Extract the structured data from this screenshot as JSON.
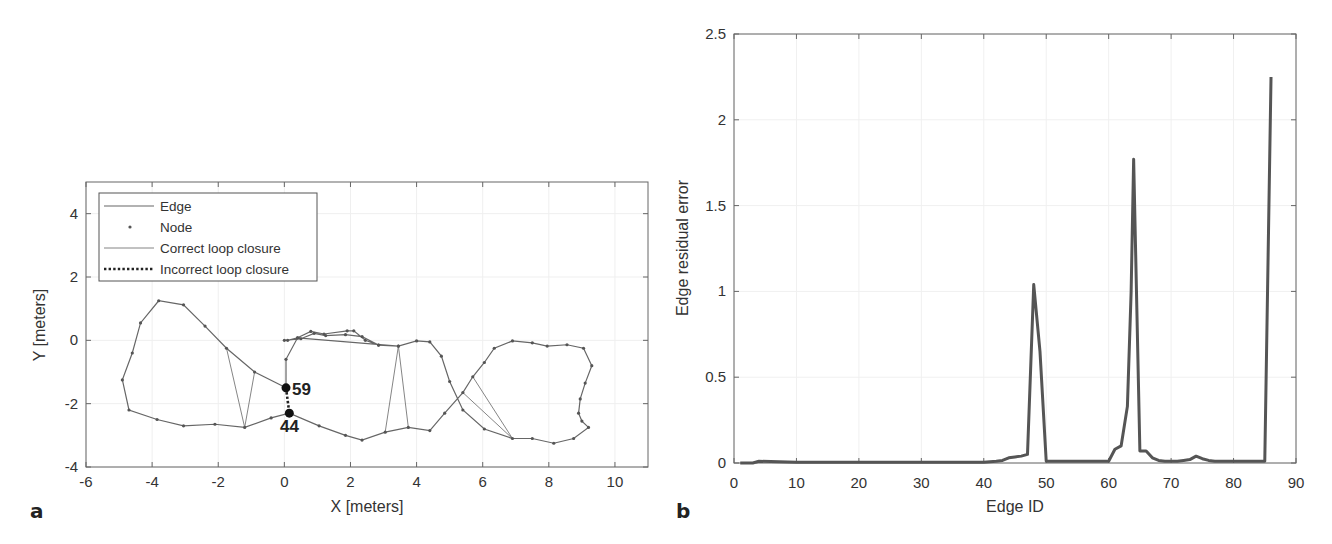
{
  "chart_data": [
    {
      "panel": "a",
      "type": "scatter",
      "title": "",
      "xlabel": "X [meters]",
      "ylabel": "Y [meters]",
      "xlim": [
        -6,
        11
      ],
      "ylim": [
        -4,
        5
      ],
      "xticks": [
        "-6",
        "-4",
        "-2",
        "0",
        "2",
        "4",
        "6",
        "8",
        "10"
      ],
      "yticks": [
        "-4",
        "-2",
        "0",
        "2",
        "4"
      ],
      "grid": true,
      "legend": {
        "position": "upper-left",
        "entries": [
          {
            "label": "Edge",
            "style": "solid-line"
          },
          {
            "label": "Node",
            "style": "dot"
          },
          {
            "label": "Correct loop closure",
            "style": "thin-line"
          },
          {
            "label": "Incorrect loop closure",
            "style": "dotted-line"
          }
        ]
      },
      "annotations": [
        {
          "text": "59",
          "x": 0.05,
          "y": -1.5
        },
        {
          "text": "44",
          "x": 0.15,
          "y": -2.3
        }
      ],
      "trajectory": [
        [
          0.05,
          -1.5
        ],
        [
          -0.9,
          -1.0
        ],
        [
          -1.75,
          -0.25
        ],
        [
          -2.4,
          0.45
        ],
        [
          -3.05,
          1.12
        ],
        [
          -3.8,
          1.25
        ],
        [
          -4.35,
          0.55
        ],
        [
          -4.6,
          -0.4
        ],
        [
          -4.9,
          -1.25
        ],
        [
          -4.7,
          -2.2
        ],
        [
          -3.85,
          -2.5
        ],
        [
          -3.05,
          -2.7
        ],
        [
          -2.1,
          -2.65
        ],
        [
          -1.2,
          -2.75
        ],
        [
          -0.4,
          -2.45
        ],
        [
          0.15,
          -2.3
        ],
        [
          1.05,
          -2.7
        ],
        [
          1.85,
          -3.0
        ],
        [
          2.35,
          -3.15
        ],
        [
          3.05,
          -2.9
        ],
        [
          3.75,
          -2.75
        ],
        [
          4.4,
          -2.85
        ],
        [
          4.85,
          -2.3
        ],
        [
          5.4,
          -1.65
        ],
        [
          5.7,
          -1.15
        ],
        [
          6.05,
          -0.7
        ],
        [
          6.35,
          -0.25
        ],
        [
          6.9,
          -0.02
        ],
        [
          7.5,
          -0.08
        ],
        [
          7.95,
          -0.18
        ],
        [
          8.55,
          -0.14
        ],
        [
          9.05,
          -0.25
        ],
        [
          9.3,
          -0.8
        ],
        [
          9.1,
          -1.35
        ],
        [
          8.95,
          -1.85
        ],
        [
          8.9,
          -2.3
        ],
        [
          9.0,
          -2.55
        ],
        [
          9.2,
          -2.75
        ],
        [
          8.75,
          -3.1
        ],
        [
          8.15,
          -3.25
        ],
        [
          7.5,
          -3.1
        ],
        [
          6.9,
          -3.1
        ],
        [
          6.05,
          -2.8
        ],
        [
          5.4,
          -2.2
        ],
        [
          5.0,
          -1.3
        ],
        [
          4.75,
          -0.5
        ],
        [
          4.4,
          -0.05
        ],
        [
          4.0,
          -0.02
        ],
        [
          3.45,
          -0.18
        ],
        [
          2.85,
          -0.15
        ],
        [
          2.45,
          0.0
        ],
        [
          2.1,
          0.3
        ],
        [
          1.9,
          0.3
        ],
        [
          1.2,
          0.2
        ],
        [
          0.8,
          0.28
        ],
        [
          0.4,
          0.08
        ],
        [
          0.1,
          0.0
        ],
        [
          0.0,
          0.0
        ],
        [
          0.5,
          0.05
        ],
        [
          0.9,
          0.22
        ],
        [
          1.25,
          0.15
        ],
        [
          1.85,
          0.18
        ],
        [
          2.35,
          0.12
        ],
        [
          2.85,
          -0.15
        ],
        [
          3.45,
          -0.18
        ],
        [
          0.4,
          0.08
        ],
        [
          0.05,
          -0.6
        ],
        [
          0.05,
          -1.5
        ]
      ],
      "loop_closures_correct": [
        [
          [
            -1.75,
            -0.25
          ],
          [
            -1.2,
            -2.75
          ]
        ],
        [
          [
            -0.9,
            -1.0
          ],
          [
            -1.2,
            -2.75
          ]
        ],
        [
          [
            3.45,
            -0.18
          ],
          [
            3.05,
            -2.9
          ]
        ],
        [
          [
            3.45,
            -0.18
          ],
          [
            3.75,
            -2.75
          ]
        ],
        [
          [
            5.7,
            -1.15
          ],
          [
            6.9,
            -3.1
          ]
        ],
        [
          [
            5.4,
            -1.65
          ],
          [
            6.9,
            -3.1
          ]
        ]
      ],
      "loop_closures_incorrect": [
        [
          [
            0.05,
            -1.5
          ],
          [
            0.15,
            -2.3
          ]
        ]
      ]
    },
    {
      "panel": "b",
      "type": "line",
      "title": "",
      "xlabel": "Edge ID",
      "ylabel": "Edge residual error",
      "xlim": [
        0,
        90
      ],
      "ylim": [
        0,
        2.5
      ],
      "xticks": [
        "0",
        "10",
        "20",
        "30",
        "40",
        "50",
        "60",
        "70",
        "80",
        "90"
      ],
      "yticks": [
        "0",
        "0.5",
        "1",
        "1.5",
        "2",
        "2.5"
      ],
      "grid": true,
      "series": [
        {
          "name": "Edge residual error",
          "x": [
            1,
            3,
            4,
            10,
            20,
            30,
            40,
            42,
            43,
            44,
            45,
            46,
            47,
            48,
            49,
            50,
            55,
            60,
            61,
            62,
            63,
            63.6,
            64,
            65,
            66,
            67,
            68,
            69,
            70,
            71,
            72,
            73,
            74,
            75,
            76,
            77,
            80,
            85,
            86
          ],
          "values": [
            0.0,
            0.0,
            0.01,
            0.005,
            0.005,
            0.005,
            0.005,
            0.01,
            0.015,
            0.03,
            0.035,
            0.04,
            0.05,
            1.04,
            0.65,
            0.01,
            0.01,
            0.01,
            0.08,
            0.1,
            0.33,
            1.0,
            1.77,
            0.07,
            0.07,
            0.03,
            0.015,
            0.01,
            0.01,
            0.01,
            0.015,
            0.02,
            0.04,
            0.025,
            0.015,
            0.01,
            0.01,
            0.01,
            2.25
          ]
        }
      ]
    }
  ],
  "panels": {
    "a": {
      "label": "a",
      "xlabel": "X [meters]",
      "ylabel": "Y [meters]",
      "xticks": [
        "-6",
        "-4",
        "-2",
        "0",
        "2",
        "4",
        "6",
        "8",
        "10"
      ],
      "yticks": [
        "4",
        "2",
        "0",
        "-2",
        "-4"
      ],
      "legend": [
        "Edge",
        "Node",
        "Correct loop closure",
        "Incorrect loop closure"
      ],
      "annotations": [
        "59",
        "44"
      ]
    },
    "b": {
      "label": "b",
      "xlabel": "Edge ID",
      "ylabel": "Edge residual error",
      "xticks": [
        "0",
        "10",
        "20",
        "30",
        "40",
        "50",
        "60",
        "70",
        "80",
        "90"
      ],
      "yticks": [
        "2.5",
        "2",
        "1.5",
        "1",
        "0.5",
        "0"
      ]
    }
  },
  "colors": {
    "line": "#555555",
    "axis": "#555555",
    "grid": "#eeeeee",
    "text": "#333333"
  }
}
